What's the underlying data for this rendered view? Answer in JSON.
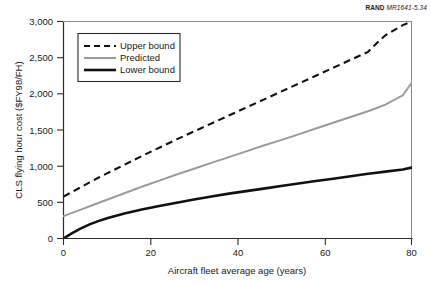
{
  "credit": {
    "mark": "RAND",
    "number": "MR1641-5.34"
  },
  "chart_data": {
    "type": "line",
    "title": "",
    "xlabel": "Aircraft fleet average age (years)",
    "ylabel": "CLS flying hour cost ($FY98/FH)",
    "xlim": [
      0,
      80
    ],
    "ylim": [
      0,
      3000
    ],
    "xticks": [
      0,
      20,
      40,
      60,
      80
    ],
    "xtick_labels": [
      "0",
      "20",
      "40",
      "60",
      "80"
    ],
    "yticks": [
      0,
      500,
      1000,
      1500,
      2000,
      2500,
      3000
    ],
    "ytick_labels": [
      "0",
      "500",
      "1,000",
      "1,500",
      "2,000",
      "2,500",
      "3,000"
    ],
    "grid": false,
    "legend_position": "upper left",
    "x": [
      0,
      2,
      4,
      6,
      8,
      10,
      14,
      18,
      22,
      26,
      30,
      34,
      38,
      42,
      46,
      50,
      54,
      58,
      62,
      66,
      70,
      72,
      74,
      78,
      80
    ],
    "series": [
      {
        "name": "Upper bound",
        "style": "dashed",
        "color": "#111111",
        "clipped_at_top": true,
        "values": [
          580,
          645,
          710,
          775,
          840,
          900,
          1020,
          1140,
          1255,
          1370,
          1480,
          1590,
          1700,
          1810,
          1920,
          2030,
          2140,
          2250,
          2360,
          2470,
          2580,
          2700,
          2810,
          2950,
          3000
        ]
      },
      {
        "name": "Predicted",
        "style": "solid",
        "color": "#9b9b9b",
        "values": [
          310,
          355,
          400,
          445,
          490,
          535,
          625,
          715,
          800,
          885,
          965,
          1045,
          1125,
          1205,
          1285,
          1360,
          1440,
          1520,
          1600,
          1680,
          1760,
          1805,
          1850,
          1980,
          2150
        ]
      },
      {
        "name": "Lower bound",
        "style": "solid-thick",
        "color": "#111111",
        "values": [
          0,
          75,
          140,
          195,
          240,
          280,
          345,
          400,
          450,
          495,
          540,
          580,
          620,
          655,
          690,
          725,
          760,
          795,
          825,
          860,
          895,
          910,
          925,
          955,
          980
        ]
      }
    ]
  },
  "legend": {
    "items": [
      {
        "label": "Upper bound"
      },
      {
        "label": "Predicted"
      },
      {
        "label": "Lower bound"
      }
    ]
  }
}
